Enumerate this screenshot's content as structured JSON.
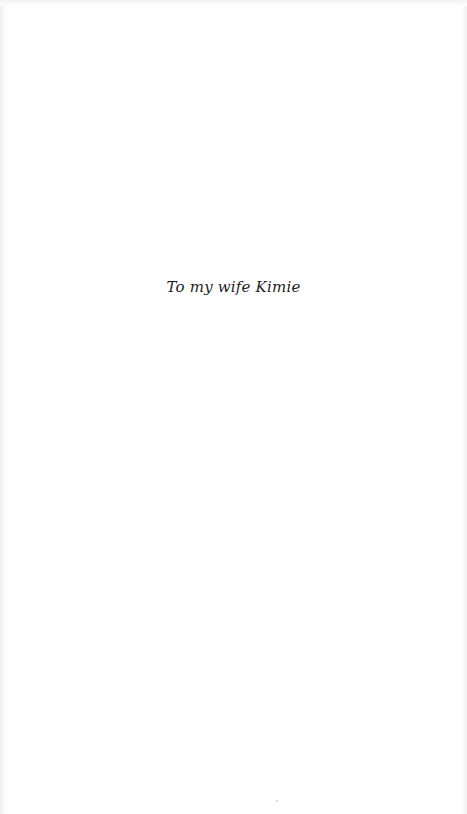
{
  "page": {
    "type": "dedication",
    "text": "To my wife Kimie"
  }
}
